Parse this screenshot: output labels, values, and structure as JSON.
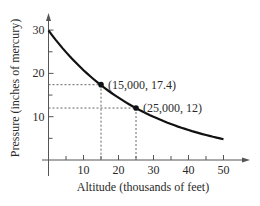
{
  "chart_data": {
    "type": "line",
    "title": "",
    "xlabel": "Altitude (thousands of feet)",
    "ylabel": "Pressure (inches of mercury)",
    "xlim": [
      0,
      55
    ],
    "ylim": [
      0,
      35
    ],
    "x_ticks": [
      10,
      20,
      30,
      40,
      50
    ],
    "x_minor_ticks": [
      5,
      15,
      25,
      35,
      45
    ],
    "y_ticks": [
      10,
      20,
      30
    ],
    "y_minor_ticks": [
      5,
      15,
      25
    ],
    "grid": false,
    "legend": null,
    "series": [
      {
        "name": "Pressure vs Altitude",
        "x": [
          0,
          5,
          10,
          15,
          20,
          25,
          30,
          35,
          40,
          45,
          50
        ],
        "values": [
          29.9,
          24.9,
          20.8,
          17.4,
          14.5,
          12.0,
          10.0,
          8.3,
          6.9,
          5.8,
          5.3
        ]
      }
    ],
    "annotations": [
      {
        "x": 15,
        "y": 17.4,
        "label": "(15,000, 17.4)"
      },
      {
        "x": 25,
        "y": 12,
        "label": "(25,000, 12)"
      }
    ]
  },
  "colors": {
    "curve": "#111111",
    "axes": "#555555",
    "dashed": "#666666",
    "text": "#2a2a2a"
  }
}
